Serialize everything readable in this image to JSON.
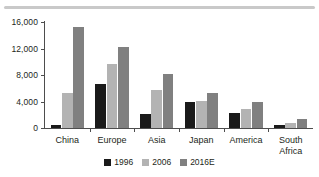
{
  "chart_data": {
    "type": "bar",
    "title": "",
    "subtitle": "",
    "xlabel": "",
    "ylabel": "",
    "ylim": [
      0,
      16000
    ],
    "yticks": [
      0,
      4000,
      8000,
      12000,
      16000
    ],
    "ytick_labels": [
      "0",
      "4,000",
      "8,000",
      "12,000",
      "16,000"
    ],
    "grid": false,
    "legend_position": "bottom",
    "categories": [
      "China",
      "Europe",
      "Asia",
      "Japan",
      "America",
      "South Africa"
    ],
    "category_label_lines": [
      [
        "China"
      ],
      [
        "Europe"
      ],
      [
        "Asia"
      ],
      [
        "Japan"
      ],
      [
        "America"
      ],
      [
        "South",
        "Africa"
      ]
    ],
    "series": [
      {
        "name": "1996",
        "color": "#1a1a1a",
        "values": [
          400,
          6700,
          2050,
          3900,
          2300,
          400
        ]
      },
      {
        "name": "2006",
        "color": "#b3b3b3",
        "values": [
          5300,
          9700,
          5700,
          4100,
          2900,
          800
        ]
      },
      {
        "name": "2016E",
        "color": "#808080",
        "values": [
          15200,
          12300,
          8200,
          5300,
          4000,
          1300
        ]
      }
    ]
  },
  "legend": {
    "items": [
      {
        "label": "1996",
        "color": "#1a1a1a"
      },
      {
        "label": "2006",
        "color": "#b3b3b3"
      },
      {
        "label": "2016E",
        "color": "#808080"
      }
    ]
  },
  "colors": {
    "axis": "#4d4d4d",
    "text": "#231f20",
    "rule": "#c9c9c9",
    "background": "#ffffff"
  }
}
